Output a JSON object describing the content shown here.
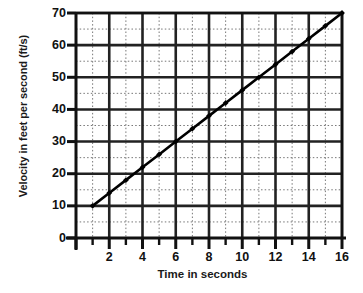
{
  "chart_data": {
    "type": "line",
    "title": "",
    "subtitle": "",
    "xlabel": "Time in seconds",
    "ylabel": "Velocity in feet per second (ft/s)",
    "xlim": [
      0,
      16
    ],
    "ylim": [
      0,
      70
    ],
    "grid": true,
    "legend": null,
    "x_major_ticks": [
      0,
      2,
      4,
      6,
      8,
      10,
      12,
      14,
      16
    ],
    "x_major_tick_labels": [
      "",
      "2",
      "4",
      "6",
      "8",
      "10",
      "12",
      "14",
      "16"
    ],
    "x_minor_ticks": [
      1,
      3,
      5,
      7,
      9,
      11,
      13,
      15
    ],
    "y_major_ticks": [
      0,
      10,
      20,
      30,
      40,
      50,
      60,
      70
    ],
    "y_major_tick_labels": [
      "0",
      "10",
      "20",
      "30",
      "40",
      "50",
      "60",
      "70"
    ],
    "y_minor_ticks": [
      5,
      15,
      25,
      35,
      45,
      55,
      65
    ],
    "series": [
      {
        "name": "velocity",
        "marker": "diamond",
        "color": "#000000",
        "x": [
          1,
          2,
          3,
          4,
          5,
          6,
          7,
          8,
          9,
          10,
          11,
          12,
          13,
          14,
          15,
          16
        ],
        "values": [
          10,
          14,
          18,
          22,
          26,
          30,
          34,
          38,
          42,
          46,
          50,
          54,
          58,
          62,
          66,
          70
        ]
      }
    ],
    "annotations": []
  },
  "colors": {
    "background": "#ffffff",
    "axis": "#111111",
    "major_grid": "#222222",
    "minor_grid": "#777777",
    "series": "#000000"
  }
}
